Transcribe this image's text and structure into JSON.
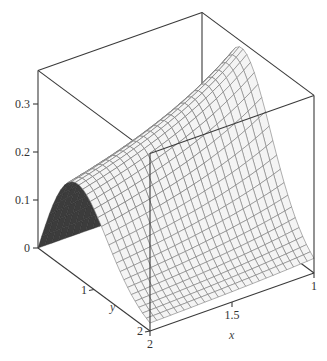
{
  "chart_data": {
    "type": "surface3d",
    "title": "",
    "function_estimate": "z = y*exp(-y^2)/(x+0.2)",
    "x": {
      "label": "x",
      "range": [
        1,
        2
      ],
      "ticks": [
        {
          "value": 1,
          "label": "1"
        },
        {
          "value": 1.5,
          "label": "1.5"
        },
        {
          "value": 2,
          "label": "2"
        }
      ]
    },
    "y": {
      "label": "y",
      "range": [
        0,
        2
      ],
      "ticks": [
        {
          "value": 0,
          "label": "0"
        },
        {
          "value": 1,
          "label": "1"
        },
        {
          "value": 2,
          "label": "2"
        }
      ]
    },
    "z": {
      "label": "",
      "range": [
        0,
        0.37
      ],
      "ticks": [
        {
          "value": 0,
          "label": "0"
        },
        {
          "value": 0.1,
          "label": "0.1"
        },
        {
          "value": 0.2,
          "label": "0.2"
        },
        {
          "value": 0.3,
          "label": "0.3"
        }
      ]
    },
    "grid_resolution": {
      "nx": 24,
      "ny": 30
    },
    "samples": [
      {
        "x": 2,
        "y": 0,
        "z": 0
      },
      {
        "x": 2,
        "y": 0.7,
        "z": 0.19
      },
      {
        "x": 2,
        "y": 2,
        "z": 0.017
      },
      {
        "x": 1,
        "y": 0,
        "z": 0
      },
      {
        "x": 1,
        "y": 0.7,
        "z": 0.36
      },
      {
        "x": 1,
        "y": 2,
        "z": 0.031
      }
    ],
    "style": {
      "surface_color": "#f4f4f4",
      "mesh_color": "#7a7a7a",
      "underside_color": "#3c3c3c",
      "box_color": "#3a3a3a"
    },
    "axes_style": "boxed"
  }
}
